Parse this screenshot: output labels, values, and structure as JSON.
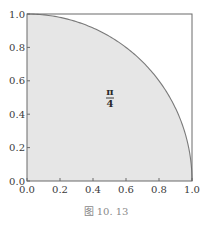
{
  "chart_data": {
    "type": "area",
    "title": "",
    "xlabel": "",
    "ylabel": "",
    "xlim": [
      0.0,
      1.0
    ],
    "ylim": [
      0.0,
      1.0
    ],
    "grid": false,
    "x_ticks": [
      "0.0",
      "0.2",
      "0.4",
      "0.6",
      "0.8",
      "1.0"
    ],
    "y_ticks": [
      "0.0",
      "0.2",
      "0.4",
      "0.6",
      "0.8",
      "1.0"
    ],
    "series": [
      {
        "name": "quarter-circle",
        "equation": "y = sqrt(1 - x^2)",
        "x": [
          0.0,
          0.1,
          0.2,
          0.3,
          0.4,
          0.5,
          0.6,
          0.7,
          0.8,
          0.9,
          0.95,
          1.0
        ],
        "y": [
          1.0,
          0.995,
          0.98,
          0.954,
          0.917,
          0.866,
          0.8,
          0.714,
          0.6,
          0.436,
          0.312,
          0.0
        ],
        "fill": "#e6e6e6",
        "line_color": "#7a7a7a"
      }
    ],
    "annotations": [
      {
        "text_numerator": "π",
        "text_denominator": "4",
        "x": 0.5,
        "y": 0.5,
        "meaning": "shaded area = π/4"
      }
    ],
    "caption": "图 10. 13",
    "legend": null
  },
  "colors": {
    "fill": "#e6e6e6",
    "curve": "#7a7a7a",
    "axes": "#6a6a6a",
    "text": "#3a3a3a",
    "caption": "#8a8a8a"
  }
}
